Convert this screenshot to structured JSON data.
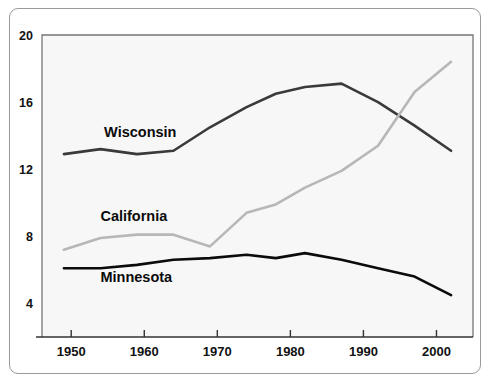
{
  "figure": {
    "background_color": "#ffffff",
    "frame_color": "#9a9a9a",
    "plot_background_color": "#f7f7f7",
    "plot_border_color": "#767676",
    "top_crop_text": "...."
  },
  "chart_data": {
    "type": "line",
    "title": "",
    "subtitle": "",
    "xlabel": "",
    "ylabel": "",
    "xlim": [
      1946,
      2005
    ],
    "ylim": [
      2,
      20
    ],
    "grid": false,
    "legend_position": "inline-labels",
    "xticks": [
      1950,
      1960,
      1970,
      1980,
      1990,
      2000
    ],
    "xtick_labels": [
      "1950",
      "1960",
      "1970",
      "1980",
      "1990",
      "2000"
    ],
    "yticks": [
      4,
      8,
      12,
      16,
      20
    ],
    "ytick_labels": [
      "4",
      "8",
      "12",
      "16",
      "20"
    ],
    "series": [
      {
        "name": "Wisconsin",
        "color": "#3a3a3a",
        "line_width": 2.6,
        "label_x": 1954.5,
        "label_y": 13.9,
        "x": [
          1949,
          1954,
          1959,
          1964,
          1969,
          1974,
          1978,
          1982,
          1987,
          1992,
          1997,
          2002
        ],
        "values": [
          12.9,
          13.2,
          12.9,
          13.1,
          14.5,
          15.7,
          16.5,
          16.9,
          17.1,
          16.0,
          14.6,
          13.1
        ]
      },
      {
        "name": "California",
        "color": "#b7b7b7",
        "line_width": 2.6,
        "label_x": 1954.0,
        "label_y": 8.9,
        "x": [
          1949,
          1954,
          1959,
          1964,
          1969,
          1974,
          1978,
          1982,
          1987,
          1992,
          1997,
          2002
        ],
        "values": [
          7.2,
          7.9,
          8.1,
          8.1,
          7.4,
          9.4,
          9.9,
          10.9,
          11.9,
          13.4,
          16.6,
          18.4
        ]
      },
      {
        "name": "Minnesota",
        "color": "#0b0b0b",
        "line_width": 2.6,
        "label_x": 1954.0,
        "label_y": 5.3,
        "x": [
          1949,
          1954,
          1959,
          1964,
          1969,
          1974,
          1978,
          1982,
          1987,
          1992,
          1997,
          2002
        ],
        "values": [
          6.1,
          6.1,
          6.3,
          6.6,
          6.7,
          6.9,
          6.7,
          7.0,
          6.6,
          6.1,
          5.6,
          4.5
        ]
      }
    ]
  }
}
